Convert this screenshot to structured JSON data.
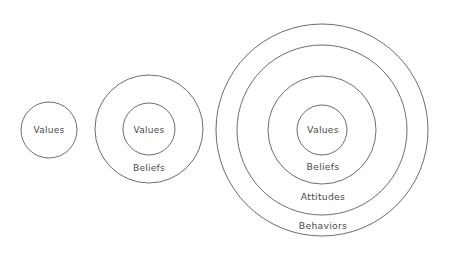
{
  "figure": {
    "background_color": "#ffffff",
    "stroke_color": "#5b5b5b",
    "text_color": "#4a4a4a"
  },
  "groups": [
    {
      "name": "group-1-values-only",
      "center": {
        "x": 49,
        "y": 130
      },
      "rings": [
        {
          "label": "Values",
          "radius": 28,
          "label_x": 49,
          "label_y": 130
        }
      ]
    },
    {
      "name": "group-2-values-beliefs",
      "center": {
        "x": 149,
        "y": 129
      },
      "rings": [
        {
          "label": "Beliefs",
          "radius": 54,
          "label_x": 149,
          "label_y": 168
        },
        {
          "label": "Values",
          "radius": 26,
          "label_x": 149,
          "label_y": 130
        }
      ]
    },
    {
      "name": "group-3-values-beliefs-attitudes-behaviors",
      "center": {
        "x": 322,
        "y": 130
      },
      "rings": [
        {
          "label": "Behaviors",
          "radius": 106,
          "label_x": 323,
          "label_y": 226
        },
        {
          "label": "Attitudes",
          "radius": 85,
          "label_x": 323,
          "label_y": 197
        },
        {
          "label": "Beliefs",
          "radius": 54,
          "label_x": 323,
          "label_y": 167
        },
        {
          "label": "Values",
          "radius": 25,
          "label_x": 323,
          "label_y": 130
        }
      ]
    }
  ],
  "labels": {
    "values": "Values",
    "beliefs": "Beliefs",
    "attitudes": "Attitudes",
    "behaviors": "Behaviors"
  }
}
